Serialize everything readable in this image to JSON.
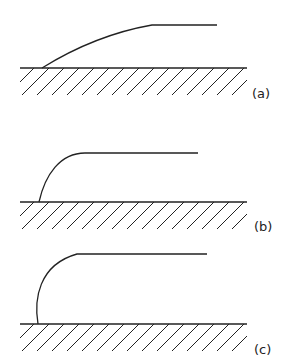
{
  "figure": {
    "stroke_color": "#222222",
    "panels": [
      {
        "id": "a",
        "label": "(a)",
        "surface": {
          "x1": 20,
          "x2": 247,
          "y": 68
        },
        "profile": {
          "start_x": 42,
          "curve_end_x": 152,
          "top_y": 25,
          "end_x": 217,
          "shape": "gentle slope"
        },
        "label_pos": {
          "x": 252,
          "y": 86
        }
      },
      {
        "id": "b",
        "label": "(b)",
        "surface": {
          "x1": 20,
          "x2": 247,
          "y": 202
        },
        "profile": {
          "start_x": 39,
          "curve_end_x": 85,
          "top_y": 153,
          "end_x": 198,
          "shape": "steep rounded rise"
        },
        "label_pos": {
          "x": 254,
          "y": 219
        }
      },
      {
        "id": "c",
        "label": "(c)",
        "surface": {
          "x1": 20,
          "x2": 247,
          "y": 324
        },
        "profile": {
          "start_x": 38,
          "curve_end_x": 77,
          "top_y": 254,
          "end_x": 207,
          "shape": "near-vertical rounded rise"
        },
        "label_pos": {
          "x": 254,
          "y": 342
        }
      }
    ]
  }
}
